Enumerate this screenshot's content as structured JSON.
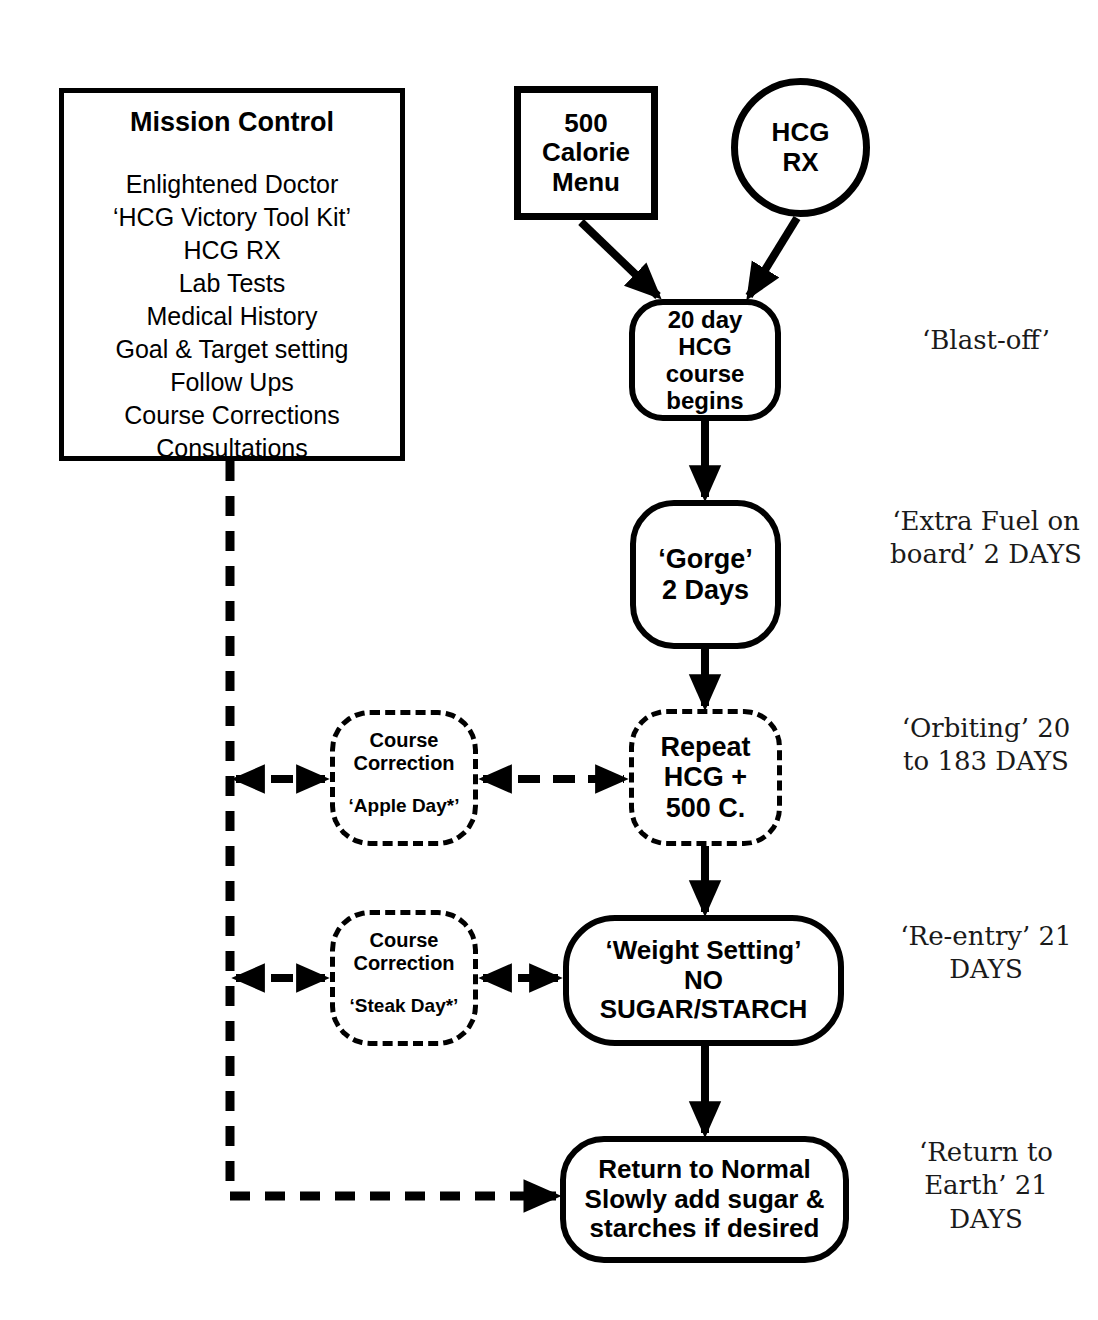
{
  "mission_control": {
    "title": "Mission Control",
    "items": [
      "Enlightened Doctor",
      "‘HCG Victory Tool Kit’",
      "HCG RX",
      "Lab Tests",
      "Medical History",
      "Goal & Target setting",
      "Follow Ups",
      "Course Corrections",
      "Consultations"
    ]
  },
  "nodes": {
    "calorie_menu": {
      "lines": [
        "500",
        "Calorie",
        "Menu"
      ],
      "shape": "rectangle",
      "border": "solid"
    },
    "hcg_rx": {
      "lines": [
        "HCG",
        "RX"
      ],
      "shape": "circle",
      "border": "solid"
    },
    "course_begins": {
      "lines": [
        "20 day",
        "HCG",
        "course",
        "begins"
      ],
      "shape": "rounded-rectangle",
      "border": "solid"
    },
    "gorge": {
      "lines": [
        "‘Gorge’",
        "2 Days"
      ],
      "shape": "rounded-rectangle",
      "border": "solid"
    },
    "repeat_hcg": {
      "lines": [
        "Repeat",
        "HCG +",
        "500 C."
      ],
      "shape": "rounded-rectangle",
      "border": "dashed"
    },
    "weight_setting": {
      "lines": [
        "‘Weight Setting’",
        "NO",
        "SUGAR/STARCH"
      ],
      "shape": "rounded-rectangle",
      "border": "solid"
    },
    "return_normal": {
      "lines": [
        "Return to Normal",
        "Slowly add sugar &",
        "starches if desired"
      ],
      "shape": "rounded-rectangle",
      "border": "solid"
    },
    "apple_day": {
      "head_lines": [
        "Course",
        "Correction"
      ],
      "sub": "‘Apple Day*’",
      "shape": "rounded-rectangle",
      "border": "dashed"
    },
    "steak_day": {
      "head_lines": [
        "Course",
        "Correction"
      ],
      "sub": "‘Steak Day*’",
      "shape": "rounded-rectangle",
      "border": "dashed"
    }
  },
  "phases": {
    "blastoff": {
      "lines": [
        "‘Blast-off’"
      ]
    },
    "extrafuel": {
      "lines": [
        "‘Extra Fuel",
        "on board’",
        "2 DAYS"
      ]
    },
    "orbiting": {
      "lines": [
        "‘Orbiting’",
        "20 to 183",
        "DAYS"
      ]
    },
    "reentry": {
      "lines": [
        "‘Re-entry’",
        "21 DAYS"
      ]
    },
    "return": {
      "lines": [
        "‘Return to",
        "Earth’",
        "21 DAYS"
      ]
    }
  },
  "colors": {
    "ink": "#000000",
    "background": "#ffffff"
  }
}
